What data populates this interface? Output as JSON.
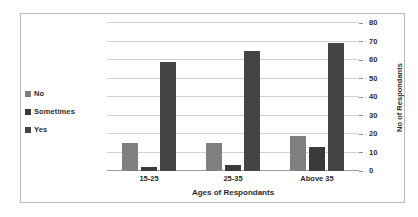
{
  "chart_data": {
    "type": "bar",
    "title": "",
    "xlabel": "Ages of Respondants",
    "ylabel": "No of Respondants",
    "categories": [
      "15-25",
      "25-35",
      "Above 35"
    ],
    "series": [
      {
        "name": "No",
        "values": [
          15,
          15,
          19
        ],
        "color": "#7f7f7f"
      },
      {
        "name": "Sometimes",
        "values": [
          2,
          3,
          13
        ],
        "color": "#3a3a3a"
      },
      {
        "name": "Yes",
        "values": [
          59,
          65,
          69
        ],
        "color": "#444444"
      }
    ],
    "ylim": [
      0,
      80
    ],
    "yticks": [
      0,
      10,
      20,
      30,
      40,
      50,
      60,
      70,
      80
    ],
    "ytick_labels": [
      "0",
      "10",
      "20",
      "30",
      "40",
      "50",
      "60",
      "70",
      "80"
    ],
    "grid": true,
    "y_axis_position": "right",
    "legend_position": "left",
    "frame": true
  },
  "legend": {
    "items": [
      {
        "label": "No",
        "color": "#7f7f7f"
      },
      {
        "label": "Sometimes",
        "color": "#3a3a3a"
      },
      {
        "label": "Yes",
        "color": "#444444"
      }
    ]
  },
  "colors": {
    "grid": "#d2d2d2",
    "axis": "#9a9a9a",
    "border": "#b9b9b9",
    "text": "#2b2b2b",
    "background": "#ffffff"
  }
}
